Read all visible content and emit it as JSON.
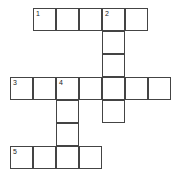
{
  "puzzle": {
    "cell_size": 23,
    "origin_x": 10,
    "origin_y": 8,
    "cells": [
      {
        "r": 0,
        "c": 1,
        "num": "1"
      },
      {
        "r": 0,
        "c": 2
      },
      {
        "r": 0,
        "c": 3
      },
      {
        "r": 0,
        "c": 4,
        "num": "2"
      },
      {
        "r": 0,
        "c": 5
      },
      {
        "r": 1,
        "c": 4
      },
      {
        "r": 2,
        "c": 4
      },
      {
        "r": 3,
        "c": 0,
        "num": "3"
      },
      {
        "r": 3,
        "c": 1
      },
      {
        "r": 3,
        "c": 2,
        "num": "4"
      },
      {
        "r": 3,
        "c": 3
      },
      {
        "r": 3,
        "c": 4
      },
      {
        "r": 3,
        "c": 5
      },
      {
        "r": 3,
        "c": 6
      },
      {
        "r": 4,
        "c": 2
      },
      {
        "r": 4,
        "c": 4
      },
      {
        "r": 5,
        "c": 2
      },
      {
        "r": 6,
        "c": 0,
        "num": "5"
      },
      {
        "r": 6,
        "c": 1
      },
      {
        "r": 6,
        "c": 2
      },
      {
        "r": 6,
        "c": 3
      }
    ]
  }
}
